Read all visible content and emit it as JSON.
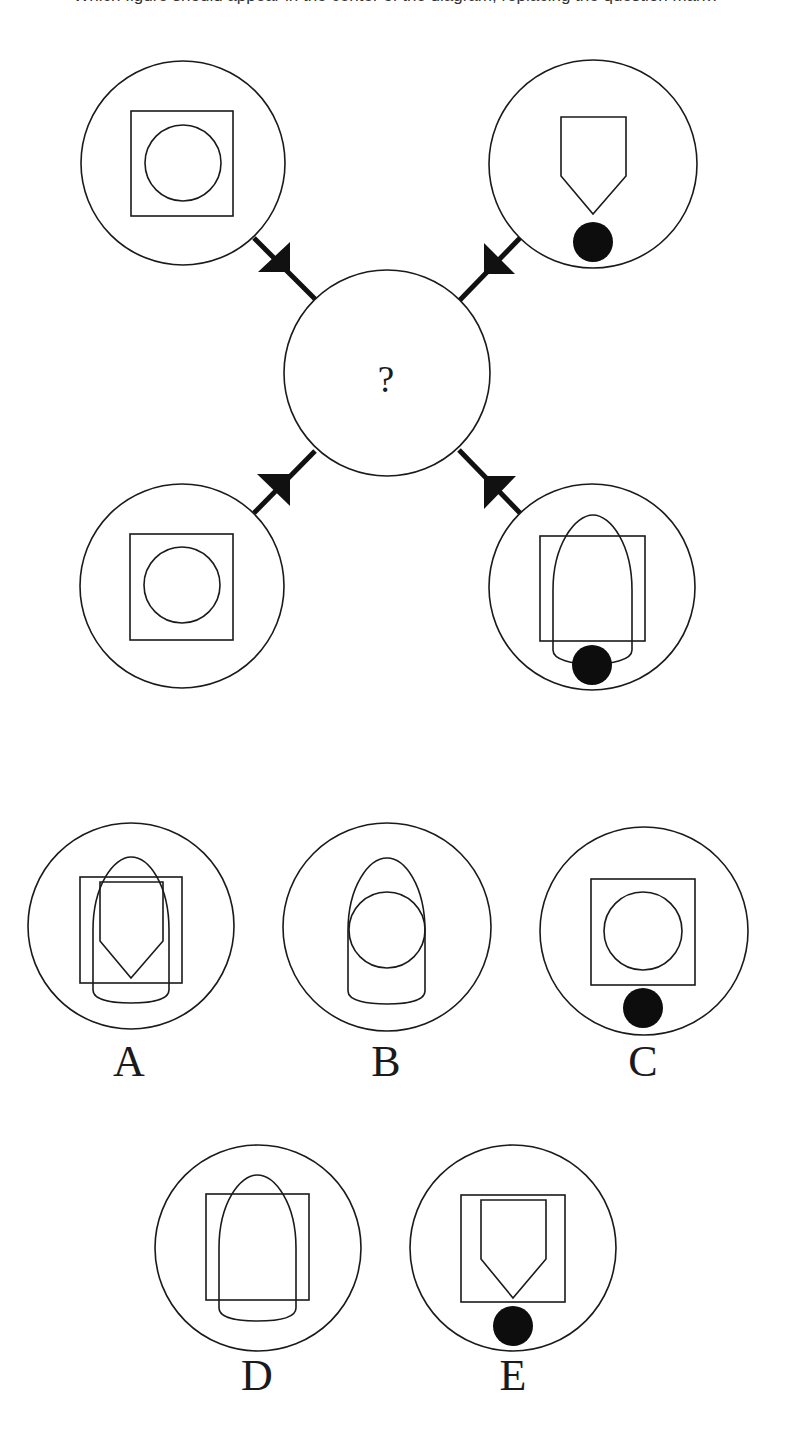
{
  "header": {
    "caption_clipped": "Which figure should appear in the center of the diagram, replacing the question mark?"
  },
  "puzzle": {
    "center": {
      "symbol": "?",
      "cx": 387,
      "cy": 373,
      "r": 103
    },
    "surrounding_cells": [
      {
        "position": "top-left",
        "cx": 183,
        "cy": 163,
        "r": 102,
        "contents": [
          "square",
          "circle"
        ]
      },
      {
        "position": "top-right",
        "cx": 593,
        "cy": 164,
        "r": 104,
        "contents": [
          "pentagon-shield",
          "black-dot"
        ]
      },
      {
        "position": "bottom-left",
        "cx": 182,
        "cy": 586,
        "r": 102,
        "contents": [
          "square",
          "circle"
        ]
      },
      {
        "position": "bottom-right",
        "cx": 592,
        "cy": 587,
        "r": 103,
        "contents": [
          "square",
          "bullet-arch",
          "black-dot"
        ]
      }
    ],
    "connectors": [
      {
        "from": "top-left",
        "direction": "toward-center"
      },
      {
        "from": "top-right",
        "direction": "toward-center"
      },
      {
        "from": "bottom-left",
        "direction": "toward-center"
      },
      {
        "from": "bottom-right",
        "direction": "toward-center"
      }
    ]
  },
  "options": [
    {
      "label": "A",
      "contents": [
        "square",
        "bullet-arch",
        "pentagon-shield"
      ]
    },
    {
      "label": "B",
      "contents": [
        "bullet-arch",
        "circle"
      ]
    },
    {
      "label": "C",
      "contents": [
        "square",
        "circle",
        "black-dot"
      ]
    },
    {
      "label": "D",
      "contents": [
        "square",
        "bullet-arch"
      ]
    },
    {
      "label": "E",
      "contents": [
        "square",
        "pentagon-shield",
        "black-dot"
      ]
    }
  ],
  "colors": {
    "stroke": "#1a1a1a",
    "fill_dot": "#0d0d0d",
    "background": "#ffffff"
  }
}
